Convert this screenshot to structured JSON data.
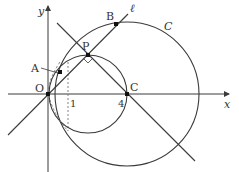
{
  "figure": {
    "type": "geometry-diagram",
    "labels": {
      "x_axis": "x",
      "y_axis": "y",
      "origin": "O",
      "point_A": "A",
      "point_B": "B",
      "point_P": "P",
      "point_C": "C",
      "line_l": "ℓ",
      "circle_C": "C",
      "tick_1": "1",
      "tick_4": "4"
    },
    "colors": {
      "stroke": "#3a3a3a",
      "dashed": "#777777",
      "background": "#ffffff"
    }
  }
}
